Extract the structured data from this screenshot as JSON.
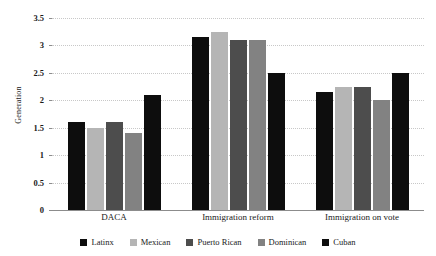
{
  "chart_data": {
    "type": "bar",
    "title": "",
    "xlabel": "",
    "ylabel": "Generation",
    "ylim": [
      0,
      3.5
    ],
    "yticks": [
      "0",
      "0.5",
      "1",
      "1.5",
      "2",
      "2.5",
      "3",
      "3.5"
    ],
    "ytick_values": [
      0,
      0.5,
      1,
      1.5,
      2,
      2.5,
      3,
      3.5
    ],
    "grid": true,
    "legend_position": "bottom",
    "categories": [
      "DACA",
      "Immigration reform",
      "Immigration on vote"
    ],
    "series": [
      {
        "name": "Latinx",
        "color": "#0d0d0d",
        "values": [
          1.6,
          3.15,
          2.15
        ]
      },
      {
        "name": "Mexican",
        "color": "#b5b5b5",
        "values": [
          1.5,
          3.25,
          2.25
        ]
      },
      {
        "name": "Puerto Rican",
        "color": "#4d4d4d",
        "values": [
          1.6,
          3.1,
          2.25
        ]
      },
      {
        "name": "Dominican",
        "color": "#828282",
        "values": [
          1.4,
          3.1,
          2.0
        ]
      },
      {
        "name": "Cuban",
        "color": "#0d0d0d",
        "values": [
          2.1,
          2.5,
          2.5
        ]
      }
    ]
  },
  "axes": {
    "y_title": "Generation"
  }
}
